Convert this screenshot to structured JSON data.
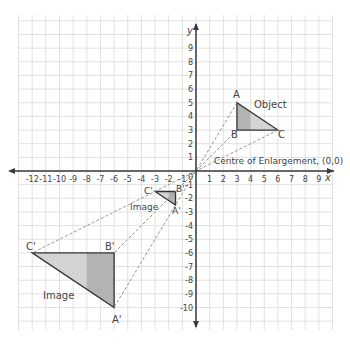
{
  "diagram": {
    "axes": {
      "x_label": "x",
      "y_label": "y",
      "x_ticks": [
        "-12",
        "-11",
        "-10",
        "-9",
        "-8",
        "-7",
        "-6",
        "-5",
        "-4",
        "-3",
        "-2",
        "-1",
        "1",
        "2",
        "3",
        "4",
        "5",
        "6",
        "7",
        "8",
        "9"
      ],
      "y_ticks": [
        "9",
        "8",
        "7",
        "6",
        "5",
        "4",
        "3",
        "2",
        "1",
        "-1",
        "-2",
        "-3",
        "-4",
        "-5",
        "-6",
        "-7",
        "-8",
        "-9",
        "-10"
      ],
      "origin_label": "0",
      "x_range": [
        -13,
        10
      ],
      "y_range": [
        -11,
        11
      ]
    },
    "labels": {
      "object": "Object",
      "image_small": "Image",
      "image_large": "Image",
      "centre": "Centre of Enlargement, (0,0)",
      "A": "A",
      "B": "B",
      "C": "C",
      "A1": "A'",
      "B1": "B'",
      "C1": "C'",
      "A2": "A'",
      "B2": "B'",
      "C2": "C'"
    },
    "shapes": {
      "object": {
        "A": [
          3,
          5
        ],
        "B": [
          3,
          3
        ],
        "C": [
          6,
          3
        ]
      },
      "image_scale_minus_half": {
        "A": [
          -1.5,
          -2.5
        ],
        "B": [
          -1.5,
          -1.5
        ],
        "C": [
          -3,
          -1.5
        ]
      },
      "image_scale_minus_two": {
        "A": [
          -6,
          -10
        ],
        "B": [
          -6,
          -6
        ],
        "C": [
          -12,
          -6
        ]
      }
    },
    "colors": {
      "grid": "#d9d9d9",
      "axis": "#3a3a3a",
      "fill_light": "#d4d4d4",
      "fill_dark": "#b3b3b3",
      "dashed": "#8a8a8a",
      "text": "#444444"
    }
  }
}
